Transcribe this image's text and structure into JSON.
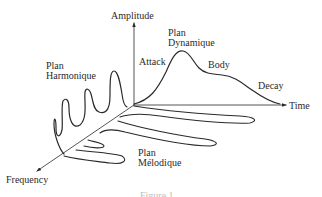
{
  "diagram": {
    "axes": {
      "amplitude": "Amplitude",
      "time": "Time",
      "frequency": "Frequency"
    },
    "planes": {
      "dynamic": [
        "Plan",
        "Dynamique"
      ],
      "harmonic": [
        "Plan",
        "Harmonique"
      ],
      "melodic": [
        "Plan",
        "Mélodique"
      ]
    },
    "envelope_stages": {
      "attack": "Attack",
      "body": "Body",
      "decay": "Decay"
    },
    "caption": "Figure 1",
    "colors": {
      "line": "#2a2a2a",
      "background": "#ffffff"
    }
  }
}
